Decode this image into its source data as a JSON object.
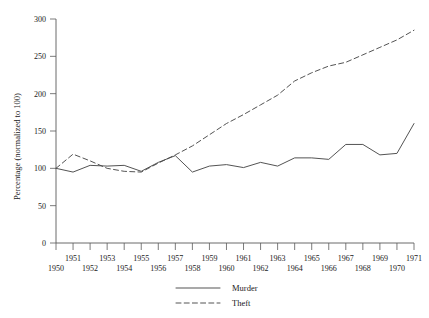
{
  "chart_data": {
    "type": "line",
    "title": "",
    "xlabel": "",
    "ylabel": "Percentage (normalized to 100)",
    "xlim": [
      1950,
      1971
    ],
    "ylim": [
      0,
      300
    ],
    "grid": false,
    "legend_position": "bottom-center",
    "x": [
      1950,
      1951,
      1952,
      1953,
      1954,
      1955,
      1956,
      1957,
      1958,
      1959,
      1960,
      1961,
      1962,
      1963,
      1964,
      1965,
      1966,
      1967,
      1968,
      1969,
      1970,
      1971
    ],
    "xticks": [
      "1950",
      "1951",
      "1952",
      "1953",
      "1954",
      "1955",
      "1956",
      "1957",
      "1958",
      "1959",
      "1960",
      "1961",
      "1962",
      "1963",
      "1964",
      "1965",
      "1966",
      "1967",
      "1968",
      "1969",
      "1970",
      "1971"
    ],
    "yticks": [
      "0",
      "50",
      "100",
      "150",
      "200",
      "250",
      "300"
    ],
    "series": [
      {
        "name": "Murder",
        "style": "solid",
        "values": [
          100,
          95,
          104,
          103,
          104,
          96,
          108,
          117,
          95,
          103,
          105,
          101,
          108,
          103,
          114,
          114,
          112,
          132,
          132,
          118,
          120,
          160
        ]
      },
      {
        "name": "Theft",
        "style": "dashed",
        "values": [
          100,
          119,
          110,
          100,
          96,
          95,
          107,
          118,
          130,
          145,
          160,
          172,
          185,
          198,
          217,
          228,
          237,
          242,
          252,
          262,
          272,
          285
        ]
      }
    ]
  },
  "legend": {
    "items": [
      {
        "label": "Murder",
        "style": "solid"
      },
      {
        "label": "Theft",
        "style": "dashed"
      }
    ]
  },
  "colors": {
    "axis": "#5a5a5a",
    "line": "#4a4a4a",
    "text": "#1a1a1a",
    "background": "#ffffff"
  }
}
